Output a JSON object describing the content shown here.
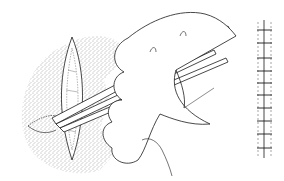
{
  "illustration": {
    "subject": "surgical wound closure line drawing",
    "panels": [
      {
        "name": "incision-with-instrument",
        "description": "stippled skin ellipse with open incision, hand holding forceps/needle holder"
      },
      {
        "name": "closed-suture-line",
        "description": "vertical closed wound with interrupted sutures",
        "suture_count": 10
      }
    ],
    "colors": {
      "ink": "#1a1a1a",
      "background": "#ffffff",
      "stipple": "#555555"
    }
  }
}
